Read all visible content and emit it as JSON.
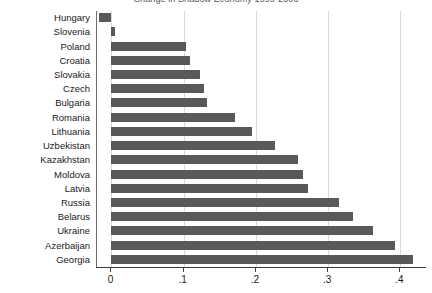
{
  "chart_data": {
    "type": "bar",
    "orientation": "horizontal",
    "title": "Change in Shadow Economy 1999-2006",
    "xlabel": "",
    "ylabel": "",
    "xlim": [
      -0.02,
      0.437
    ],
    "grid": true,
    "legend": false,
    "xticks": [
      "0",
      ".1",
      ".2",
      ".3",
      ".4"
    ],
    "xtick_values": [
      0,
      0.1,
      0.2,
      0.3,
      0.4
    ],
    "categories": [
      "Hungary",
      "Slovenia",
      "Poland",
      "Croatia",
      "Slovakia",
      "Czech",
      "Bulgaria",
      "Romania",
      "Lithuania",
      "Uzbekistan",
      "Kazakhstan",
      "Moldova",
      "Latvia",
      "Russia",
      "Belarus",
      "Ukraine",
      "Azerbaijan",
      "Georgia"
    ],
    "values": [
      -0.017,
      0.005,
      0.103,
      0.109,
      0.122,
      0.128,
      0.133,
      0.171,
      0.195,
      0.227,
      0.259,
      0.265,
      0.272,
      0.315,
      0.335,
      0.362,
      0.392,
      0.418
    ],
    "bar_color": "#595959",
    "grid_color": "#d9d9d9",
    "axis_color": "#3d3d3d"
  }
}
